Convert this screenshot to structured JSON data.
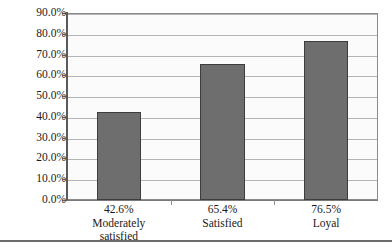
{
  "chart_data": {
    "type": "bar",
    "title": "",
    "subtitle": "",
    "xlabel": "",
    "ylabel": "",
    "categories": [
      "Moderately satisfied",
      "Satisfied",
      "Loyal"
    ],
    "category_lines": [
      [
        "Moderately",
        "satisfied"
      ],
      [
        "Satisfied"
      ],
      [
        "Loyal"
      ]
    ],
    "values": [
      42.6,
      65.4,
      76.5
    ],
    "value_labels": [
      "42.6%",
      "65.4%",
      "76.5%"
    ],
    "ylim": [
      0,
      90
    ],
    "ytick_values": [
      0,
      10,
      20,
      30,
      40,
      50,
      60,
      70,
      80,
      90
    ],
    "ytick_labels": [
      "0.0%",
      "10.0%",
      "20.0%",
      "30.0%",
      "40.0%",
      "50.0%",
      "60.0%",
      "70.0%",
      "80.0%",
      "90.0%"
    ],
    "grid": true,
    "grid_axis": "y",
    "legend": false,
    "legend_position": "none",
    "series": [
      {
        "name": "",
        "values": [
          42.6,
          65.4,
          76.5
        ]
      }
    ],
    "colors": {
      "bar_fill": "#6e6e6e",
      "bar_border": "#3d3d3d",
      "plot_background": "#fbfbfb",
      "gridline": "#b4b4b4",
      "axis": "#5a5a5a",
      "text": "#1a1a1a",
      "page_background": "#ffffff",
      "bottom_rule": "#6b6b6b"
    }
  }
}
